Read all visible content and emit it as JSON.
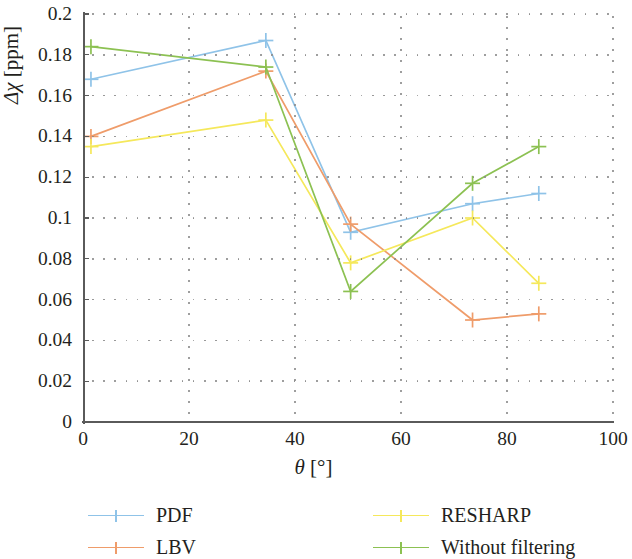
{
  "chart_data": {
    "type": "line",
    "title": "",
    "subtitle": "",
    "xlabel": "θ [°]",
    "ylabel": "Δχ [ppm]",
    "xlim": [
      0,
      100
    ],
    "ylim": [
      0,
      0.2
    ],
    "xticks": [
      "0",
      "20",
      "40",
      "60",
      "80",
      "100"
    ],
    "xtick_values": [
      0,
      20,
      40,
      60,
      80,
      100
    ],
    "yticks": [
      "0",
      "0.02",
      "0.04",
      "0.06",
      "0.08",
      "0.1",
      "0.12",
      "0.14",
      "0.16",
      "0.18",
      "0.2"
    ],
    "ytick_values": [
      0,
      0.02,
      0.04,
      0.06,
      0.08,
      0.1,
      0.12,
      0.14,
      0.16,
      0.18,
      0.2
    ],
    "grid": "dotted",
    "legend_position": "below-plot",
    "marker": "plus",
    "series": [
      {
        "name": "PDF",
        "color": "#8fc3e8",
        "x": [
          1.5,
          34.5,
          50.5,
          73.5,
          86
        ],
        "y": [
          0.168,
          0.187,
          0.093,
          0.107,
          0.112
        ]
      },
      {
        "name": "LBV",
        "color": "#ef9c6a",
        "x": [
          1.5,
          34.5,
          50.5,
          73.5,
          86
        ],
        "y": [
          0.14,
          0.172,
          0.097,
          0.05,
          0.053
        ]
      },
      {
        "name": "RESHARP",
        "color": "#f5e85b",
        "x": [
          1.5,
          34.5,
          50.5,
          73.5,
          86
        ],
        "y": [
          0.135,
          0.148,
          0.078,
          0.1,
          0.068
        ]
      },
      {
        "name": "Without filtering",
        "color": "#8cc152",
        "x": [
          1.5,
          34.5,
          50.5,
          73.5,
          86
        ],
        "y": [
          0.184,
          0.174,
          0.064,
          0.117,
          0.135
        ]
      }
    ]
  },
  "legend": {
    "items": [
      {
        "label": "PDF",
        "color": "#8fc3e8"
      },
      {
        "label": "LBV",
        "color": "#ef9c6a"
      },
      {
        "label": "RESHARP",
        "color": "#f5e85b"
      },
      {
        "label": "Without filtering",
        "color": "#8cc152"
      }
    ]
  },
  "axes": {
    "y_title_symbol": "Δχ",
    "y_title_unit": "[ppm]",
    "x_title_symbol": "θ",
    "x_title_unit": "[°]"
  }
}
